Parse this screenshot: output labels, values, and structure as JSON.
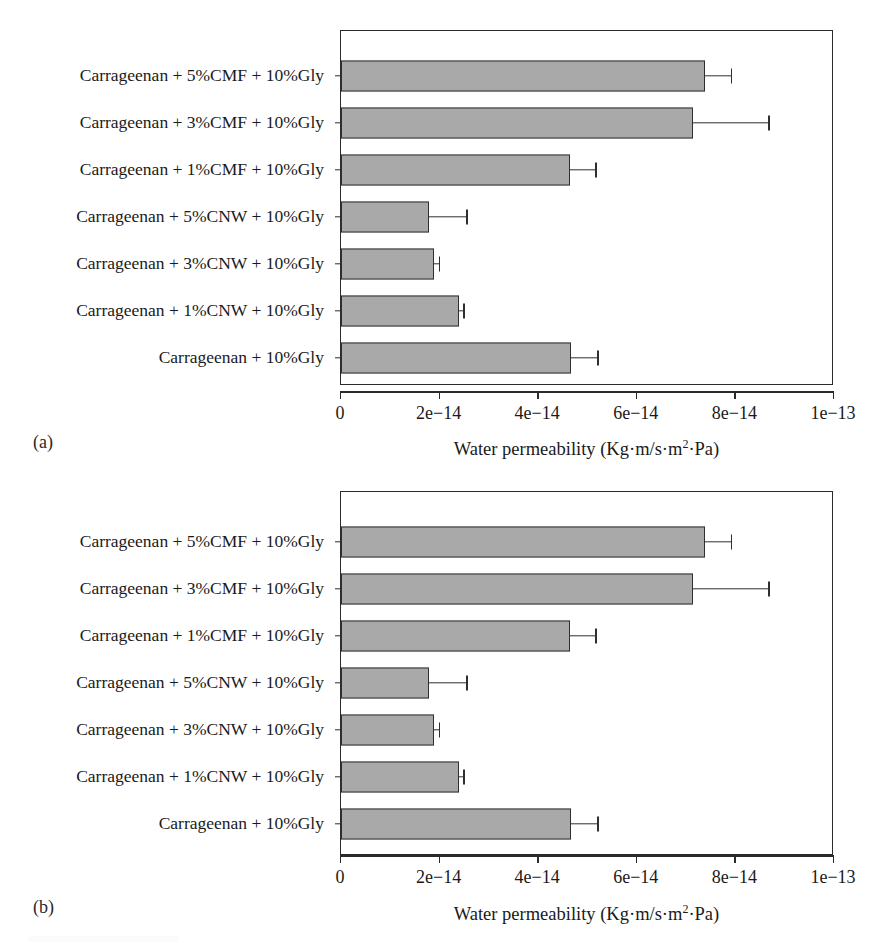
{
  "figure": {
    "panels": [
      {
        "tag": "(a)"
      },
      {
        "tag": "(b)"
      }
    ],
    "axis_title_prefix": "Water permeability (Kg·m/s·m",
    "axis_title_sup": "2",
    "axis_title_suffix": "·Pa)"
  },
  "chart_data": [
    {
      "type": "bar",
      "orientation": "horizontal",
      "panel": "(a)",
      "title": "",
      "xlabel": "Water permeability (Kg·m/s·m2·Pa)",
      "ylabel": "",
      "xlim": [
        0,
        1e-13
      ],
      "xticks": [
        0,
        2e-14,
        4e-14,
        6e-14,
        8e-14,
        1e-13
      ],
      "xticklabels": [
        "0",
        "2e−14",
        "4e−14",
        "6e−14",
        "8e−14",
        "1e−13"
      ],
      "grid": false,
      "legend": null,
      "bar_color": "#a9a9a9",
      "bar_edge_color": "#2f2f2f",
      "categories": [
        "Carrageenan + 5%CMF + 10%Gly",
        "Carrageenan + 3%CMF + 10%Gly",
        "Carrageenan + 1%CMF + 10%Gly",
        "Carrageenan + 5%CNW + 10%Gly",
        "Carrageenan + 3%CNW + 10%Gly",
        "Carrageenan + 1%CNW + 10%Gly",
        "Carrageenan + 10%Gly"
      ],
      "values": [
        7.38e-14,
        7.15e-14,
        4.65e-14,
        1.79e-14,
        1.89e-14,
        2.4e-14,
        4.67e-14
      ],
      "errors": [
        5.3e-15,
        1.52e-14,
        5.1e-15,
        7.5e-15,
        1e-15,
        8e-16,
        5.3e-15
      ]
    },
    {
      "type": "bar",
      "orientation": "horizontal",
      "panel": "(b)",
      "title": "",
      "xlabel": "Water permeability (Kg·m/s·m2·Pa)",
      "ylabel": "",
      "xlim": [
        0,
        1e-13
      ],
      "xticks": [
        0,
        2e-14,
        4e-14,
        6e-14,
        8e-14,
        1e-13
      ],
      "xticklabels": [
        "0",
        "2e−14",
        "4e−14",
        "6e−14",
        "8e−14",
        "1e−13"
      ],
      "grid": false,
      "legend": null,
      "bar_color": "#a9a9a9",
      "bar_edge_color": "#2f2f2f",
      "categories": [
        "Carrageenan + 5%CMF + 10%Gly",
        "Carrageenan + 3%CMF + 10%Gly",
        "Carrageenan + 1%CMF + 10%Gly",
        "Carrageenan + 5%CNW + 10%Gly",
        "Carrageenan + 3%CNW + 10%Gly",
        "Carrageenan + 1%CNW + 10%Gly",
        "Carrageenan + 10%Gly"
      ],
      "values": [
        7.38e-14,
        7.15e-14,
        4.65e-14,
        1.79e-14,
        1.89e-14,
        2.4e-14,
        4.67e-14
      ],
      "errors": [
        5.3e-15,
        1.52e-14,
        5.1e-15,
        7.5e-15,
        1e-15,
        8e-16,
        5.3e-15
      ]
    }
  ]
}
